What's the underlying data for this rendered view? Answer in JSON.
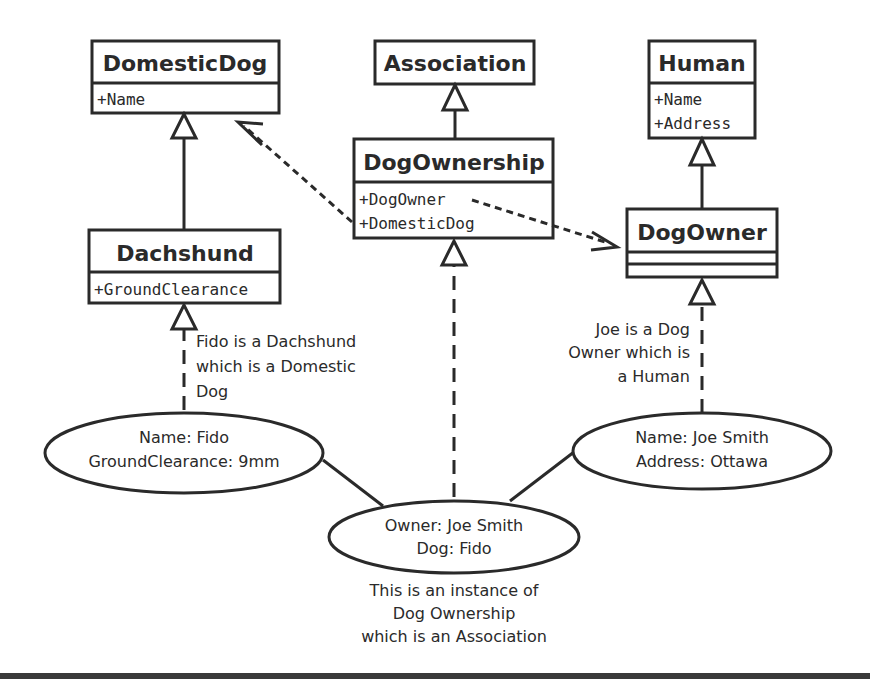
{
  "classes": {
    "domestic_dog": {
      "name": "DomesticDog",
      "attrs": [
        "+Name"
      ]
    },
    "association": {
      "name": "Association"
    },
    "human": {
      "name": "Human",
      "attrs": [
        "+Name",
        "+Address"
      ]
    },
    "dog_ownership": {
      "name": "DogOwnership",
      "attrs": [
        "+DogOwner",
        "+DomesticDog"
      ]
    },
    "dachshund": {
      "name": "Dachshund",
      "attrs": [
        "+GroundClearance"
      ]
    },
    "dog_owner": {
      "name": "DogOwner"
    }
  },
  "instances": {
    "fido": {
      "lines": [
        "Name: Fido",
        "GroundClearance: 9mm"
      ]
    },
    "joe": {
      "lines": [
        "Name: Joe Smith",
        "Address: Ottawa"
      ]
    },
    "ownership": {
      "lines": [
        "Owner: Joe Smith",
        "Dog: Fido"
      ]
    }
  },
  "notes": {
    "fido_note": [
      "Fido is a Dachshund",
      "which is a Domestic",
      "Dog"
    ],
    "joe_note": [
      "Joe is a Dog",
      "Owner which is",
      "a Human"
    ],
    "ownership_note": [
      "This is an instance of",
      "Dog Ownership",
      "which is an Association"
    ]
  },
  "colors": {
    "stroke": "#2a2a2a",
    "background": "#ffffff"
  }
}
